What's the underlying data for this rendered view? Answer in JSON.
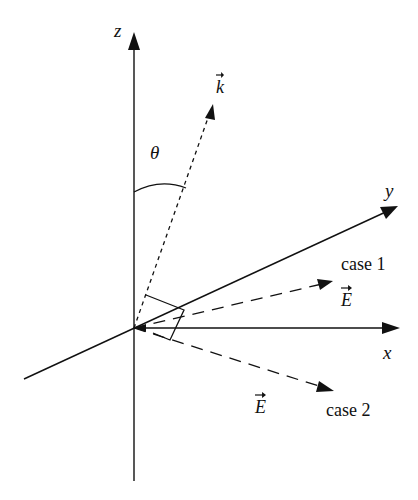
{
  "diagram": {
    "axes": {
      "z": {
        "label": "z"
      },
      "y": {
        "label": "y"
      },
      "x": {
        "label": "x"
      }
    },
    "vectors": {
      "k": {
        "label": "k",
        "style": "dotted"
      },
      "E_case1": {
        "label": "E",
        "style": "dashed"
      },
      "E_case2": {
        "label": "E",
        "style": "dashed"
      }
    },
    "angle": {
      "label": "θ"
    },
    "cases": {
      "case1": "case 1",
      "case2": "case 2"
    },
    "colors": {
      "ink": "#111111",
      "background": "#ffffff"
    }
  }
}
